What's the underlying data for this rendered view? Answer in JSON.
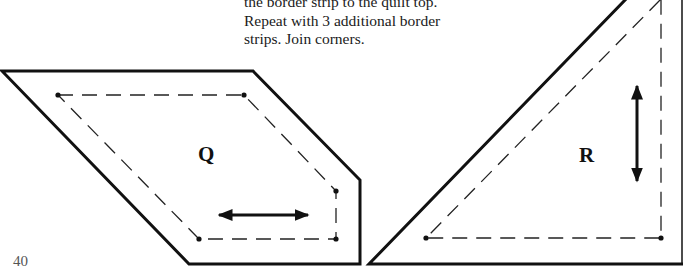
{
  "instructions": {
    "lines": [
      "the border strip to the quilt top.",
      "Repeat with 3 additional border",
      "strips. Join corners."
    ]
  },
  "templates": [
    {
      "id": "Q",
      "label": "Q",
      "grain_arrow": "horizontal",
      "outer_cut_line": [
        [
          2,
          71
        ],
        [
          253,
          71
        ],
        [
          360,
          180
        ],
        [
          360,
          264
        ],
        [
          189,
          264
        ]
      ],
      "inner_seam_line": [
        [
          58,
          95
        ],
        [
          244,
          95
        ],
        [
          336,
          191
        ],
        [
          336,
          239
        ],
        [
          199,
          239
        ]
      ],
      "arrow": {
        "x1": 217,
        "y1": 215,
        "x2": 310,
        "y2": 215
      }
    },
    {
      "id": "R",
      "label": "R",
      "grain_arrow": "vertical",
      "outer_cut_line": [
        [
          369,
          264
        ],
        [
          627,
          0
        ],
        [
          682,
          0
        ],
        [
          682,
          264
        ]
      ],
      "inner_seam_line": [
        [
          426,
          238
        ],
        [
          660,
          0
        ],
        [
          661,
          238
        ]
      ],
      "arrow": {
        "x1": 637,
        "y1": 84,
        "x2": 637,
        "y2": 183
      }
    }
  ],
  "page_number": "40",
  "colors": {
    "line": "#111111",
    "text": "#1a1a1a",
    "page_number": "#555555"
  }
}
